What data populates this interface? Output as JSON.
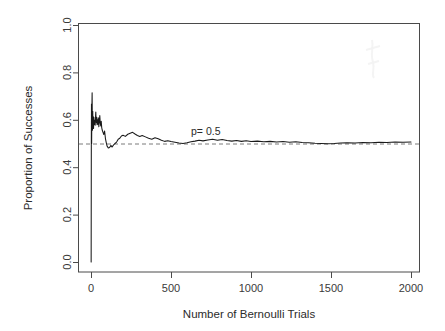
{
  "chart_data": {
    "type": "line",
    "title": "",
    "xlabel": "Number of Bernoulli Trials",
    "ylabel": "Proportion of Successes",
    "xlim": [
      0,
      2000
    ],
    "ylim": [
      0.0,
      1.0
    ],
    "grid": false,
    "legend": "none",
    "xticks": [
      0,
      500,
      1000,
      1500,
      2000
    ],
    "xtick_labels": [
      "0",
      "500",
      "1000",
      "1500",
      "2000"
    ],
    "yticks": [
      0.0,
      0.2,
      0.4,
      0.6,
      0.8,
      1.0
    ],
    "ytick_labels": [
      "0.0",
      "0.2",
      "0.4",
      "0.6",
      "0.8",
      "1.0"
    ],
    "annotations": [
      {
        "text": "p= 0.5",
        "x": 1000,
        "y": 0.535
      }
    ],
    "reference_lines": [
      {
        "name": "p-reference",
        "orientation": "horizontal",
        "y": 0.5,
        "style": "dashed",
        "color": "#7a7a7a"
      }
    ],
    "series": [
      {
        "name": "running-proportion",
        "color": "#1a1a1a",
        "style": "solid",
        "x": [
          1,
          2,
          3,
          4,
          5,
          6,
          7,
          8,
          9,
          10,
          11,
          12,
          13,
          14,
          15,
          16,
          17,
          18,
          19,
          20,
          22,
          24,
          26,
          28,
          30,
          32,
          34,
          36,
          38,
          40,
          43,
          46,
          49,
          52,
          55,
          58,
          61,
          64,
          67,
          70,
          75,
          80,
          85,
          90,
          95,
          100,
          108,
          116,
          124,
          132,
          140,
          150,
          160,
          170,
          180,
          190,
          200,
          215,
          230,
          245,
          260,
          275,
          290,
          305,
          320,
          340,
          360,
          380,
          400,
          420,
          440,
          460,
          480,
          500,
          525,
          550,
          575,
          600,
          625,
          650,
          675,
          700,
          730,
          760,
          790,
          820,
          850,
          880,
          910,
          940,
          970,
          1000,
          1040,
          1080,
          1120,
          1160,
          1200,
          1240,
          1280,
          1320,
          1360,
          1400,
          1440,
          1480,
          1520,
          1560,
          1600,
          1650,
          1700,
          1750,
          1800,
          1850,
          1900,
          1950,
          2000
        ],
        "y": [
          0.0,
          0.5,
          0.667,
          0.5,
          0.6,
          0.667,
          0.714,
          0.625,
          0.556,
          0.6,
          0.636,
          0.583,
          0.615,
          0.571,
          0.6,
          0.563,
          0.588,
          0.611,
          0.579,
          0.6,
          0.591,
          0.583,
          0.577,
          0.607,
          0.633,
          0.594,
          0.588,
          0.611,
          0.579,
          0.6,
          0.581,
          0.609,
          0.571,
          0.596,
          0.618,
          0.586,
          0.574,
          0.594,
          0.567,
          0.557,
          0.547,
          0.538,
          0.553,
          0.522,
          0.505,
          0.49,
          0.481,
          0.483,
          0.492,
          0.485,
          0.493,
          0.5,
          0.506,
          0.518,
          0.522,
          0.532,
          0.535,
          0.53,
          0.539,
          0.543,
          0.547,
          0.54,
          0.534,
          0.53,
          0.534,
          0.528,
          0.522,
          0.518,
          0.524,
          0.52,
          0.514,
          0.509,
          0.512,
          0.508,
          0.505,
          0.502,
          0.5,
          0.503,
          0.507,
          0.51,
          0.514,
          0.511,
          0.515,
          0.518,
          0.514,
          0.517,
          0.513,
          0.51,
          0.513,
          0.509,
          0.512,
          0.508,
          0.51,
          0.507,
          0.509,
          0.506,
          0.508,
          0.505,
          0.507,
          0.504,
          0.503,
          0.501,
          0.5,
          0.499,
          0.5,
          0.502,
          0.503,
          0.502,
          0.504,
          0.503,
          0.505,
          0.504,
          0.506,
          0.505,
          0.506
        ],
        "description": "Running proportion of successes converging to 0.5 by the Law of Large Numbers"
      }
    ]
  },
  "figure": {
    "background": "#ffffff",
    "axis_color": "#4a4a4a",
    "series_color": "#1a1a1a",
    "reference_color": "#7a7a7a"
  }
}
